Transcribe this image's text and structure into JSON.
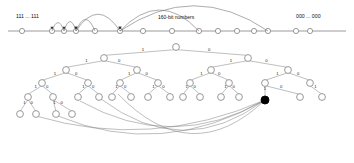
{
  "figure": {
    "colors": {
      "axis": "#9a9a9a",
      "node_stroke": "#8d8d8d",
      "node_fill": "#ffffff",
      "highlight": "#000000",
      "arc": "#666666",
      "text": "#111111"
    }
  },
  "number_line": {
    "left_label": "111 ... 111",
    "center_label": "160-bit numbers",
    "right_label": "000 ... 000",
    "node_positions": [
      22,
      52,
      64,
      76,
      95,
      120,
      143,
      172,
      199,
      218,
      237,
      254,
      268,
      296,
      310
    ],
    "arcs": [
      {
        "from": 64,
        "to": 52,
        "height": 8
      },
      {
        "from": 76,
        "to": 64,
        "height": 9
      },
      {
        "from": 95,
        "to": 76,
        "height": 11
      },
      {
        "from": 120,
        "to": 76,
        "height": 16
      },
      {
        "from": 199,
        "to": 120,
        "height": 20
      },
      {
        "from": 268,
        "to": 120,
        "height": 24
      }
    ]
  },
  "tree": {
    "edge_label_left": "1",
    "edge_label_right": "0",
    "root": {
      "x": 176,
      "y": 47
    },
    "levels": [
      {
        "level": 0,
        "nodes": [
          {
            "x": 176,
            "y": 47
          }
        ]
      },
      {
        "level": 1,
        "nodes": [
          {
            "x": 104,
            "y": 58
          },
          {
            "x": 248,
            "y": 58
          }
        ]
      },
      {
        "level": 2,
        "nodes": [
          {
            "x": 66,
            "y": 70
          },
          {
            "x": 137,
            "y": 70
          },
          {
            "x": 211,
            "y": 70
          },
          {
            "x": 288,
            "y": 70
          }
        ]
      },
      {
        "level": 3,
        "nodes": [
          {
            "x": 42,
            "y": 83
          },
          {
            "x": 88,
            "y": 83
          },
          {
            "x": 120,
            "y": 83
          },
          {
            "x": 158,
            "y": 83
          },
          {
            "x": 190,
            "y": 83
          },
          {
            "x": 229,
            "y": 83
          },
          {
            "x": 265,
            "y": 83
          },
          {
            "x": 310,
            "y": 83
          }
        ]
      },
      {
        "level": 4,
        "nodes": [
          {
            "x": 28,
            "y": 97
          },
          {
            "x": 53,
            "y": 97
          },
          {
            "x": 78,
            "y": 97
          },
          {
            "x": 99,
            "y": 97
          },
          {
            "x": 112,
            "y": 97
          },
          {
            "x": 131,
            "y": 97
          },
          {
            "x": 148,
            "y": 97
          },
          {
            "x": 170,
            "y": 97
          },
          {
            "x": 183,
            "y": 97
          },
          {
            "x": 200,
            "y": 97
          },
          {
            "x": 221,
            "y": 97
          },
          {
            "x": 239,
            "y": 97
          },
          {
            "x": 265,
            "y": 100
          },
          {
            "x": 300,
            "y": 97
          },
          {
            "x": 322,
            "y": 97
          }
        ]
      },
      {
        "level": 5,
        "nodes": [
          {
            "x": 20,
            "y": 114
          },
          {
            "x": 36,
            "y": 114
          },
          {
            "x": 56,
            "y": 114
          },
          {
            "x": 72,
            "y": 114
          }
        ]
      }
    ],
    "highlighted_node": {
      "x": 265,
      "y": 100,
      "filled": true
    },
    "long_chords_target": {
      "x": 265,
      "y": 100
    },
    "long_chords_sources": [
      {
        "x": 36,
        "y": 116
      },
      {
        "x": 58,
        "y": 116
      },
      {
        "x": 80,
        "y": 101
      },
      {
        "x": 101,
        "y": 99
      },
      {
        "x": 118,
        "y": 94
      }
    ]
  }
}
